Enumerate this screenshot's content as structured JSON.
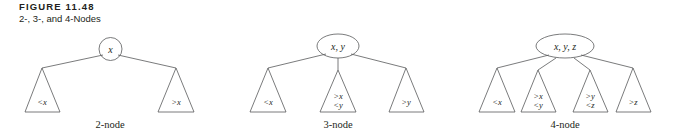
{
  "figure": {
    "title": "FIGURE 11.48",
    "subtitle": "2-, 3-, and 4-Nodes"
  },
  "colors": {
    "stroke": "#58595b",
    "text": "#231f20",
    "background": "#ffffff"
  },
  "diagrams": [
    {
      "id": "two-node",
      "caption": "2-node",
      "root_label": "x",
      "root_shape": "circle",
      "children": [
        {
          "line1": "<x",
          "line2": ""
        },
        {
          "line1": ">x",
          "line2": ""
        }
      ]
    },
    {
      "id": "three-node",
      "caption": "3-node",
      "root_label": "x, y",
      "root_shape": "ellipse",
      "children": [
        {
          "line1": "<x",
          "line2": ""
        },
        {
          "line1": ">x",
          "line2": "<y"
        },
        {
          "line1": ">y",
          "line2": ""
        }
      ]
    },
    {
      "id": "four-node",
      "caption": "4-node",
      "root_label": "x, y, z",
      "root_shape": "ellipse",
      "children": [
        {
          "line1": "<x",
          "line2": ""
        },
        {
          "line1": ">x",
          "line2": "<y"
        },
        {
          "line1": ">y",
          "line2": "<z"
        },
        {
          "line1": ">z",
          "line2": ""
        }
      ]
    }
  ]
}
